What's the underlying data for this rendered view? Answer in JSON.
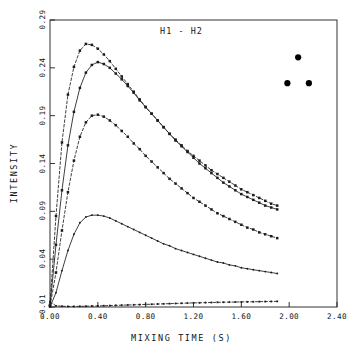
{
  "chart_data": {
    "type": "line",
    "title": "H1 - H2",
    "xlabel": "MIXING TIME (S)",
    "ylabel": "INTENSITY",
    "xlim": [
      0.0,
      2.4
    ],
    "ylim": [
      -0.01,
      0.29
    ],
    "xticks": [
      "0.00",
      "0.40",
      "0.80",
      "1.20",
      "1.60",
      "2.00",
      "2.40"
    ],
    "xtick_values": [
      0.0,
      0.4,
      0.8,
      1.2,
      1.6,
      2.0,
      2.4
    ],
    "yticks": [
      "0.29",
      "0.24",
      "0.19",
      "0.14",
      "0.09",
      "0.04",
      "-0.01"
    ],
    "ytick_values": [
      0.29,
      0.24,
      0.19,
      0.14,
      0.09,
      0.04,
      -0.01
    ],
    "grid": false,
    "legend": null,
    "x": [
      0.0,
      0.05,
      0.1,
      0.15,
      0.2,
      0.25,
      0.3,
      0.35,
      0.4,
      0.45,
      0.5,
      0.55,
      0.6,
      0.65,
      0.7,
      0.75,
      0.8,
      0.85,
      0.9,
      0.95,
      1.0,
      1.05,
      1.1,
      1.15,
      1.2,
      1.25,
      1.3,
      1.35,
      1.4,
      1.45,
      1.5,
      1.55,
      1.6,
      1.65,
      1.7,
      1.75,
      1.8,
      1.85,
      1.9
    ],
    "series": [
      {
        "name": "curve-1",
        "style": "dashed",
        "marker": "square",
        "values": [
          -0.008,
          0.085,
          0.162,
          0.212,
          0.241,
          0.258,
          0.265,
          0.264,
          0.26,
          0.254,
          0.247,
          0.239,
          0.231,
          0.223,
          0.215,
          0.207,
          0.199,
          0.192,
          0.185,
          0.178,
          0.171,
          0.165,
          0.159,
          0.153,
          0.148,
          0.143,
          0.138,
          0.133,
          0.129,
          0.125,
          0.121,
          0.117,
          0.113,
          0.11,
          0.107,
          0.104,
          0.101,
          0.098,
          0.096
        ]
      },
      {
        "name": "curve-2",
        "style": "solid",
        "marker": "square",
        "values": [
          -0.009,
          0.055,
          0.112,
          0.159,
          0.194,
          0.219,
          0.235,
          0.243,
          0.246,
          0.244,
          0.24,
          0.234,
          0.228,
          0.221,
          0.214,
          0.206,
          0.199,
          0.192,
          0.185,
          0.178,
          0.171,
          0.164,
          0.158,
          0.152,
          0.146,
          0.14,
          0.135,
          0.13,
          0.125,
          0.12,
          0.116,
          0.112,
          0.108,
          0.105,
          0.102,
          0.099,
          0.096,
          0.094,
          0.092
        ]
      },
      {
        "name": "curve-3",
        "style": "dashed",
        "marker": "square",
        "values": [
          -0.009,
          0.026,
          0.07,
          0.11,
          0.143,
          0.168,
          0.183,
          0.19,
          0.191,
          0.189,
          0.185,
          0.18,
          0.174,
          0.168,
          0.161,
          0.155,
          0.148,
          0.142,
          0.136,
          0.13,
          0.124,
          0.119,
          0.114,
          0.109,
          0.104,
          0.1,
          0.096,
          0.092,
          0.088,
          0.085,
          0.082,
          0.079,
          0.076,
          0.073,
          0.071,
          0.068,
          0.066,
          0.064,
          0.062
        ]
      },
      {
        "name": "curve-4",
        "style": "solid",
        "marker": "dot",
        "values": [
          -0.01,
          0.005,
          0.028,
          0.049,
          0.066,
          0.078,
          0.084,
          0.086,
          0.086,
          0.085,
          0.083,
          0.08,
          0.077,
          0.074,
          0.071,
          0.068,
          0.065,
          0.062,
          0.059,
          0.056,
          0.054,
          0.051,
          0.049,
          0.047,
          0.045,
          0.043,
          0.041,
          0.039,
          0.037,
          0.036,
          0.034,
          0.033,
          0.031,
          0.03,
          0.029,
          0.028,
          0.027,
          0.026,
          0.025
        ]
      },
      {
        "name": "curve-5",
        "style": "dashed",
        "marker": "square",
        "values": [
          -0.0045,
          -0.0088,
          -0.0092,
          -0.0094,
          -0.0094,
          -0.0093,
          -0.0092,
          -0.009,
          -0.0089,
          -0.0087,
          -0.0085,
          -0.0083,
          -0.0081,
          -0.0079,
          -0.0077,
          -0.0075,
          -0.0073,
          -0.0071,
          -0.0069,
          -0.0067,
          -0.0065,
          -0.0063,
          -0.0061,
          -0.0059,
          -0.0057,
          -0.0056,
          -0.0054,
          -0.0053,
          -0.0051,
          -0.005,
          -0.0049,
          -0.0048,
          -0.0047,
          -0.0046,
          -0.0045,
          -0.0044,
          -0.0043,
          -0.0042,
          -0.0041
        ]
      }
    ],
    "annotation_points": [
      {
        "name": "dot-top",
        "x": 2.075,
        "y": 0.251
      },
      {
        "name": "dot-left",
        "x": 1.985,
        "y": 0.224
      },
      {
        "name": "dot-right",
        "x": 2.165,
        "y": 0.224
      }
    ]
  }
}
